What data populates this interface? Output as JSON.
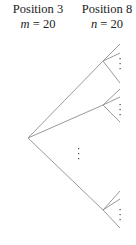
{
  "labels": {
    "left": {
      "title": "Position 3",
      "var": "m",
      "eq": " = 20"
    },
    "right": {
      "title": "Position 8",
      "var": "n",
      "eq": " = 20"
    }
  },
  "ellipsis": "⋮",
  "colors": {
    "line": "#9a9a9a",
    "text": "#222222"
  }
}
